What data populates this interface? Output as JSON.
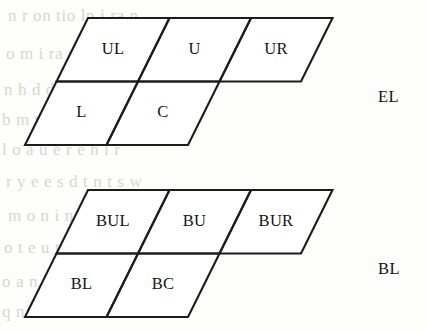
{
  "page": {
    "width": 427,
    "height": 331,
    "background_color": "#fdfdfc",
    "ink_color": "#1c1c1c",
    "bleed_color": "#cfcbc4"
  },
  "figures": [
    {
      "id": "el-neighborhood",
      "caption": "EL",
      "caption_x": 378,
      "caption_y": 87,
      "origin_x": 25,
      "origin_y": 18,
      "cell_width": 81.5,
      "cell_height": 63.5,
      "skew_per_row": 31.5,
      "rows": [
        {
          "row_index": 0,
          "cells": [
            {
              "label": "UL",
              "col": 0
            },
            {
              "label": "U",
              "col": 1
            },
            {
              "label": "UR",
              "col": 2
            }
          ]
        },
        {
          "row_index": 1,
          "cells": [
            {
              "label": "L",
              "col": 0
            },
            {
              "label": "C",
              "col": 1
            }
          ]
        }
      ]
    },
    {
      "id": "bl-neighborhood",
      "caption": "BL",
      "caption_x": 378,
      "caption_y": 259,
      "origin_x": 25,
      "origin_y": 190,
      "cell_width": 81.5,
      "cell_height": 63.5,
      "skew_per_row": 31.5,
      "rows": [
        {
          "row_index": 0,
          "cells": [
            {
              "label": "BUL",
              "col": 0
            },
            {
              "label": "BU",
              "col": 1
            },
            {
              "label": "BUR",
              "col": 2
            }
          ]
        },
        {
          "row_index": 1,
          "cells": [
            {
              "label": "BL",
              "col": 0
            },
            {
              "label": "BC",
              "col": 1
            }
          ]
        }
      ]
    }
  ],
  "background_bleed": [
    {
      "text": "n  r  on  tio    lp   i   ra          n",
      "x": 8,
      "y": 6,
      "size": 17
    },
    {
      "text": "o           m   i   ra   n           d",
      "x": 6,
      "y": 44,
      "size": 17
    },
    {
      "text": "n   h    d   d   b   t   a     o  b",
      "x": 4,
      "y": 80,
      "size": 17
    },
    {
      "text": "b   m    t   s  e   l  p   l     h   l",
      "x": 2,
      "y": 110,
      "size": 17
    },
    {
      "text": "l   o   a     u  e   r  e   h   l     r",
      "x": 2,
      "y": 140,
      "size": 17
    },
    {
      "text": "r   y    e    e  s   d   t  n  t   s   w",
      "x": 6,
      "y": 172,
      "size": 17
    },
    {
      "text": "m   o   n     i   n    h   b   n",
      "x": 8,
      "y": 206,
      "size": 17
    },
    {
      "text": "o    t   e    u  t  o   s   n  l",
      "x": 4,
      "y": 238,
      "size": 17
    },
    {
      "text": "o    a  n    n  l   e    d  e   o    n",
      "x": 2,
      "y": 272,
      "size": 17
    },
    {
      "text": "q   n    f  o   m   n  b   r  n   o  u",
      "x": 2,
      "y": 302,
      "size": 17
    }
  ]
}
